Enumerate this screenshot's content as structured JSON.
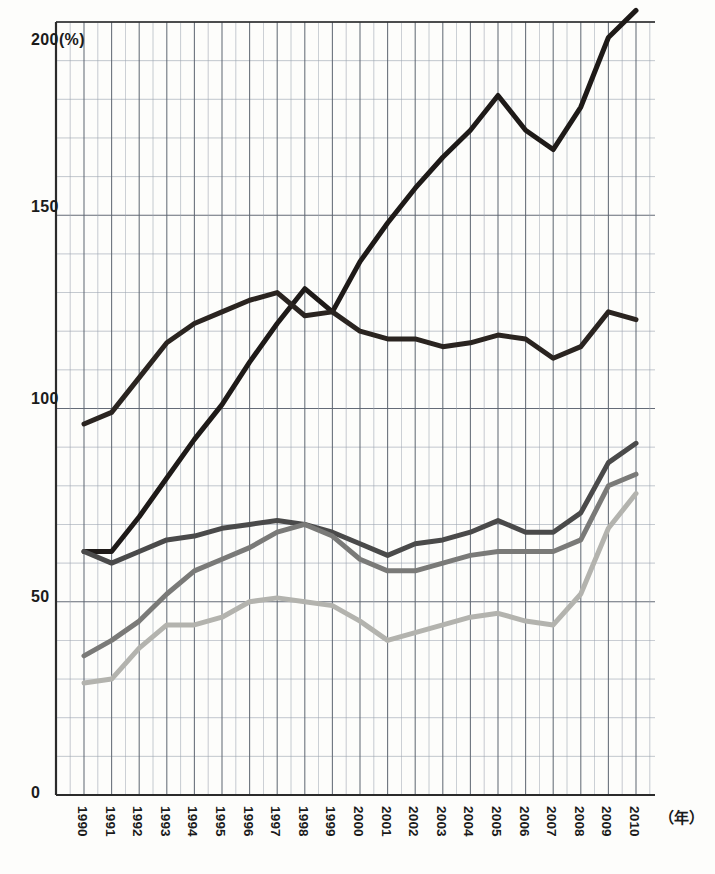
{
  "chart_data": {
    "type": "line",
    "title": "",
    "xlabel": "(年)",
    "ylabel": "200(%)",
    "x": [
      "1990",
      "1991",
      "1992",
      "1993",
      "1994",
      "1995",
      "1996",
      "1997",
      "1998",
      "1999",
      "2000",
      "2001",
      "2002",
      "2003",
      "2004",
      "2005",
      "2006",
      "2007",
      "2008",
      "2009",
      "2010"
    ],
    "xlim": [
      1990,
      2010
    ],
    "ylim": [
      0,
      200
    ],
    "grid": true,
    "y_major_ticks": [
      0,
      50,
      100,
      150,
      200
    ],
    "y_major_tick_labels": [
      "0",
      "50",
      "100",
      "150",
      "200(%)"
    ],
    "y_minor_tick_step": 10,
    "legend_position": "none",
    "series": [
      {
        "name": "series-1-steep-rise",
        "color": "#1e1a18",
        "width": 5,
        "values": [
          63,
          63,
          72,
          82,
          92,
          101,
          112,
          122,
          131,
          125,
          138,
          148,
          157,
          165,
          172,
          181,
          172,
          167,
          178,
          196,
          203
        ]
      },
      {
        "name": "series-2-peak-1998",
        "color": "#2a2420",
        "width": 5,
        "values": [
          96,
          99,
          108,
          117,
          122,
          125,
          128,
          130,
          124,
          125,
          120,
          118,
          118,
          116,
          117,
          119,
          118,
          113,
          116,
          125,
          123
        ]
      },
      {
        "name": "series-3-dark-gray",
        "color": "#4a4a4a",
        "width": 5,
        "values": [
          63,
          60,
          63,
          66,
          67,
          69,
          70,
          71,
          70,
          68,
          65,
          62,
          65,
          66,
          68,
          71,
          68,
          68,
          73,
          86,
          91
        ]
      },
      {
        "name": "series-4-medium-gray",
        "color": "#7a7a78",
        "width": 5,
        "values": [
          36,
          40,
          45,
          52,
          58,
          61,
          64,
          68,
          70,
          67,
          61,
          58,
          58,
          60,
          62,
          63,
          63,
          63,
          66,
          80,
          83
        ]
      },
      {
        "name": "series-5-light-gray",
        "color": "#b3b3ae",
        "width": 5,
        "values": [
          29,
          30,
          38,
          44,
          44,
          46,
          50,
          51,
          50,
          49,
          45,
          40,
          42,
          44,
          46,
          47,
          45,
          44,
          52,
          69,
          78
        ]
      }
    ]
  },
  "axes": {
    "y_labels": [
      "200(%)",
      "150",
      "100",
      "50",
      "0"
    ],
    "x_labels": [
      "1990",
      "1991",
      "1992",
      "1993",
      "1994",
      "1995",
      "1996",
      "1997",
      "1998",
      "1999",
      "2000",
      "2001",
      "2002",
      "2003",
      "2004",
      "2005",
      "2006",
      "2007",
      "2008",
      "2009",
      "2010"
    ],
    "x_unit": "（年）"
  },
  "colors": {
    "grid_minor": "#9aa3b0",
    "grid_major": "#5c6470",
    "axis": "#2b2b2b",
    "background": "#fdfdfb"
  }
}
